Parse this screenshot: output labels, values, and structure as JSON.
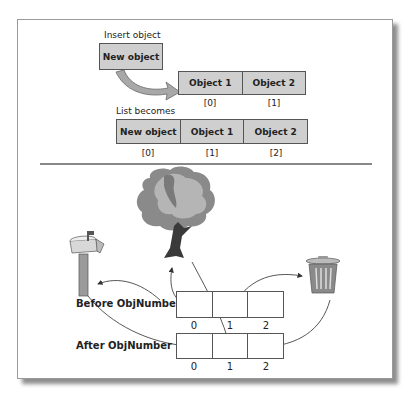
{
  "top_section": {
    "insert_label": "Insert object",
    "new_object_label": "New object",
    "initial_list": {
      "cells": [
        "Object 1",
        "Object 2"
      ],
      "indices": [
        "[0]",
        "[1]"
      ]
    },
    "list_becomes_label": "List becomes",
    "result_list": {
      "cells": [
        "New object",
        "Object 1",
        "Object 2"
      ],
      "indices": [
        "[0]",
        "[1]",
        "[2]"
      ]
    }
  },
  "bottom_section": {
    "before_label": "Before ObjNumber",
    "after_label": "After ObjNumber",
    "before_indices": [
      "0",
      "1",
      "2"
    ],
    "after_indices": [
      "0",
      "1",
      "2"
    ],
    "icons": [
      "mailbox-icon",
      "tree-icon",
      "trash-can-icon"
    ]
  },
  "colors": {
    "box_fill": "#cfcfcf",
    "arrow_fill": "#a8a8a8",
    "border": "#555555",
    "divider": "#888888"
  }
}
